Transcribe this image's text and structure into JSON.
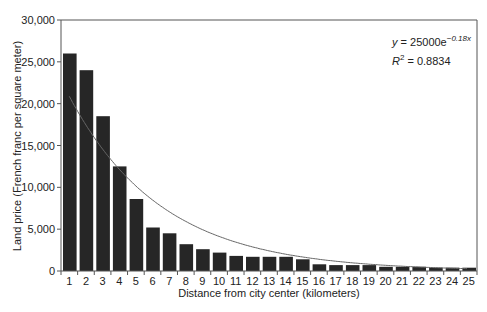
{
  "chart_data": {
    "type": "bar",
    "title": "",
    "xlabel": "Distance from city center (kilometers)",
    "ylabel": "Land price (French franc per square meter)",
    "categories": [
      "1",
      "2",
      "3",
      "4",
      "5",
      "6",
      "7",
      "8",
      "9",
      "10",
      "11",
      "12",
      "13",
      "14",
      "15",
      "16",
      "17",
      "18",
      "19",
      "20",
      "21",
      "22",
      "23",
      "24",
      "25"
    ],
    "values": [
      26000,
      24000,
      18500,
      12500,
      8600,
      5200,
      4500,
      3200,
      2600,
      2200,
      1800,
      1700,
      1700,
      1700,
      1400,
      800,
      700,
      700,
      700,
      500,
      500,
      500,
      400,
      400,
      400
    ],
    "ylim": [
      0,
      30000
    ],
    "yticks": [
      0,
      5000,
      10000,
      15000,
      20000,
      25000,
      30000
    ],
    "ytick_labels": [
      "0",
      "5,000",
      "10,000",
      "15,000",
      "20,000",
      "25,000",
      "30,000"
    ],
    "grid": false,
    "trendline": {
      "type": "exponential",
      "a": 25000,
      "b": -0.18,
      "equation_label": "y = 25000e",
      "exponent_label": "−0.18x",
      "r2_label": "R",
      "r2_value_label": " = 0.8834"
    },
    "colors": {
      "bar": "#262626",
      "line": "#666666",
      "axis": "#555555"
    }
  }
}
